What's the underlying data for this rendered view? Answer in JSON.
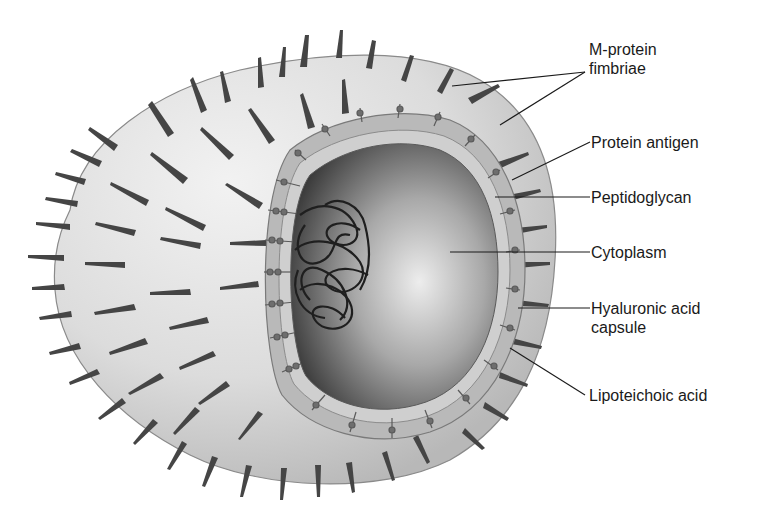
{
  "diagram": {
    "colors": {
      "background": "#ffffff",
      "surface_light": "#e6e6e6",
      "surface_mid": "#c8c8c8",
      "wall_band": "#b4b4b4",
      "cytoplasm_light": "#e2e2e2",
      "cytoplasm_dark": "#3a3a3a",
      "spike": "#4a4a4a",
      "leader_line": "#1a1a1a",
      "label_text": "#1a1a1a"
    },
    "labels": [
      {
        "id": "m-protein",
        "line1": "M-protein",
        "line2": "fimbriae"
      },
      {
        "id": "protein-antigen",
        "line1": "Protein antigen"
      },
      {
        "id": "peptidoglycan",
        "line1": "Peptidoglycan"
      },
      {
        "id": "cytoplasm",
        "line1": "Cytoplasm"
      },
      {
        "id": "hyaluronic",
        "line1": "Hyaluronic acid",
        "line2": "capsule"
      },
      {
        "id": "lipoteichoic",
        "line1": "Lipoteichoic acid"
      }
    ]
  }
}
